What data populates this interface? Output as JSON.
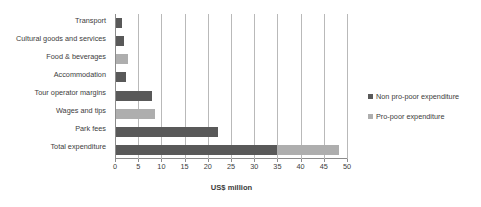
{
  "chart_data": {
    "type": "bar",
    "orientation": "horizontal",
    "stacked": true,
    "title": "",
    "xlabel": "US$ million",
    "ylabel": "",
    "xlim": [
      0,
      50
    ],
    "xticks": [
      0,
      5,
      10,
      15,
      20,
      25,
      30,
      35,
      40,
      45,
      50
    ],
    "grid": "vertical",
    "legend_position": "right",
    "categories": [
      "Transport",
      "Cultural goods and services",
      "Food & beverages",
      "Accommodation",
      "Tour operator margins",
      "Wages and tips",
      "Park fees",
      "Total expenditure"
    ],
    "series": [
      {
        "name": "Non pro-poor expenditure",
        "color": "#595959",
        "values": [
          1.2,
          1.8,
          0,
          2.2,
          7.7,
          0,
          22.0,
          34.8
        ]
      },
      {
        "name": "Pro-poor expenditure",
        "color": "#aeaeae",
        "values": [
          0,
          0,
          2.5,
          0,
          0,
          8.3,
          0,
          13.2
        ]
      }
    ]
  },
  "legend": {
    "items": [
      {
        "label": "Non pro-poor expenditure",
        "color": "#595959"
      },
      {
        "label": "Pro-poor expenditure",
        "color": "#aeaeae"
      }
    ]
  }
}
